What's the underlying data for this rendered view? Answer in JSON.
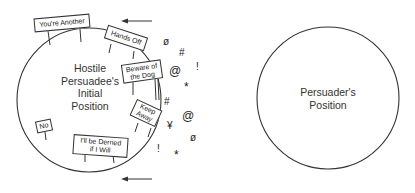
{
  "diagram": {
    "left_circle": {
      "label_lines": [
        "Hostile",
        "Persuadee's",
        "Initial",
        "Position"
      ]
    },
    "right_circle": {
      "label_lines": [
        "Persuader's",
        "Position"
      ]
    },
    "signs": [
      {
        "id": "youre-another",
        "lines": [
          "You're Another"
        ]
      },
      {
        "id": "hands-off",
        "lines": [
          "Hands Off"
        ]
      },
      {
        "id": "beware-of-the-dog",
        "lines": [
          "Beware of",
          "the Dog"
        ]
      },
      {
        "id": "keep-away",
        "lines": [
          "Keep",
          "Away"
        ]
      },
      {
        "id": "no",
        "lines": [
          "No"
        ]
      },
      {
        "id": "ill-be-derned",
        "lines": [
          "I'll be Derned",
          "if I Will"
        ]
      }
    ],
    "symbols": [
      "ø",
      "#",
      "!",
      "@",
      "*",
      "#",
      "@",
      "¥",
      "ø",
      "!",
      "*"
    ],
    "arrows": [
      {
        "direction": "left",
        "position": "top"
      },
      {
        "direction": "left",
        "position": "bottom"
      }
    ],
    "colors": {
      "line": "#333333",
      "background": "#ffffff"
    }
  }
}
